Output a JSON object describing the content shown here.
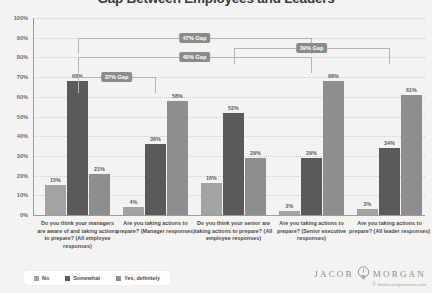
{
  "chart_data": {
    "type": "bar",
    "title": "Gap Between Employees and Leaders",
    "xlabel": "",
    "ylabel": "",
    "ylim": [
      0,
      100
    ],
    "grid": true,
    "legend_position": "bottom-left",
    "ytick_labels": [
      "100%",
      "90%",
      "80%",
      "70%",
      "60%",
      "50%",
      "40%",
      "30%",
      "20%",
      "10%",
      "0%"
    ],
    "ytick_values": [
      100,
      90,
      80,
      70,
      60,
      50,
      40,
      30,
      20,
      10,
      0
    ],
    "categories": [
      "Do you think your managers are aware of and taking actions to prepare? (All employee responses)",
      "Are you taking actions to prepare? (Manager responses)",
      "Do you think your senior are taking actions to prepare? (All employee responses)",
      "Are you taking actions to prepare? (Senior executive responses)",
      "Are you taking actions to prepare? (All leader responses)"
    ],
    "series": [
      {
        "name": "No",
        "color": "#a3a3a3",
        "values": [
          15,
          4,
          16,
          2,
          3
        ]
      },
      {
        "name": "Somewhat",
        "color": "#5a5a5a",
        "values": [
          68,
          36,
          52,
          29,
          34
        ]
      },
      {
        "name": "Yes, definitely",
        "color": "#8e8e8e",
        "values": [
          21,
          58,
          29,
          68,
          61
        ]
      }
    ],
    "value_labels": [
      [
        "15%",
        "68%",
        "21%"
      ],
      [
        "4%",
        "36%",
        "58%"
      ],
      [
        "16%",
        "52%",
        "29%"
      ],
      [
        "2%",
        "29%",
        "68%"
      ],
      [
        "3%",
        "34%",
        "61%"
      ]
    ],
    "annotations": [
      {
        "label": "37% Gap",
        "from_group": 0,
        "to_group": 1,
        "height_pct": 70
      },
      {
        "label": "40% Gap",
        "from_group": 0,
        "to_group": 3,
        "height_pct": 80
      },
      {
        "label": "47% Gap",
        "from_group": 0,
        "to_group": 3,
        "height_pct": 90
      },
      {
        "label": "39% Gap",
        "from_group": 2,
        "to_group": 4,
        "height_pct": 85
      }
    ]
  },
  "legend": {
    "items": [
      {
        "label": "No",
        "color": "#a3a3a3"
      },
      {
        "label": "Somewhat",
        "color": "#5a5a5a"
      },
      {
        "label": "Yes, definitely",
        "color": "#8e8e8e"
      }
    ]
  },
  "branding": {
    "first_name": "JACOB",
    "last_name": "MORGAN",
    "url": "thefutureorganization.com",
    "copyright_symbol": "©"
  }
}
